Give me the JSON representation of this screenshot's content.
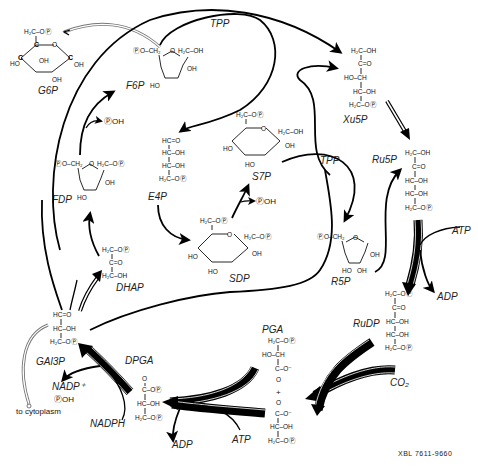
{
  "diagram": {
    "footer_code": "XBL 7611-9660",
    "compounds": {
      "g6p": {
        "label": "G6P",
        "top": "H₂C–OⓅ"
      },
      "f6p": {
        "label": "F6P",
        "left": "ⓅO–CH₂",
        "right": "H₂C–OH"
      },
      "fdp": {
        "label": "FDP",
        "left": "ⓅO–CH₂",
        "right": "H₂C–OⓅ"
      },
      "dhap": {
        "label": "DHAP",
        "lines": [
          "H₂C–OⓅ",
          "C=O",
          "H₂C–OH"
        ]
      },
      "e4p": {
        "label": "E4P",
        "lines": [
          "HC=O",
          "HC–OH",
          "HC–OH",
          "H₂C–OⓅ"
        ]
      },
      "s7p": {
        "label": "S7P",
        "top": "H₂C–OⓅ",
        "right": "H₂C–OH"
      },
      "sdp": {
        "label": "SDP",
        "top": "H₂C–OⓅ",
        "right": "H₂C–OⓅ"
      },
      "xu5p": {
        "label": "Xu5P",
        "lines": [
          "H₂C–OH",
          "C=O",
          "HO–CH",
          "HC–OH",
          "H₂C–OⓅ"
        ]
      },
      "ru5p": {
        "label": "Ru5P",
        "lines": [
          "H₂C–OH",
          "C=O",
          "HC–OH",
          "HC–OH",
          "H₂C–OⓅ"
        ]
      },
      "r5p": {
        "label": "R5P",
        "left": "ⓅO–CH₂"
      },
      "rudp": {
        "label": "RuDP",
        "lines": [
          "H₂C–OⓅ",
          "C=O",
          "HC–OH",
          "HC–OH",
          "H₂C–OⓅ"
        ]
      },
      "pga": {
        "label": "PGA",
        "top_lines": [
          "H₂C–OⓅ",
          "HO–CH",
          "C–O⁻",
          "O"
        ],
        "plus": "+",
        "bottom_lines": [
          "O",
          "C–O⁻",
          "HC–OH",
          "H₂C–OⓅ"
        ]
      },
      "dpga": {
        "label": "DPGA",
        "lines": [
          "O",
          "C–OⓅ",
          "HC–OH",
          "H₂C–OⓅ"
        ]
      },
      "gal3p": {
        "label": "GAl3P",
        "lines": [
          "HC=O",
          "HC–OH",
          "H₂C–OⓅ"
        ]
      }
    },
    "cofactors": {
      "tpp_top": "TPP",
      "tpp_mid": "TPP",
      "atp_right": "ATP",
      "adp_right": "ADP",
      "co2": "CO₂",
      "atp_bottom": "ATP",
      "adp_bottom": "ADP",
      "nadph": "NADPH",
      "nadp": "NADP⁺",
      "pi_gal": "ⓅOH",
      "pi_fdp": "ⓅOH",
      "pi_sdp": "ⓅOH"
    },
    "ring_atoms": {
      "c": "C",
      "h": "H",
      "o": "O",
      "ho": "HO",
      "oh": "OH"
    },
    "export_label": "to cytoplasm"
  }
}
